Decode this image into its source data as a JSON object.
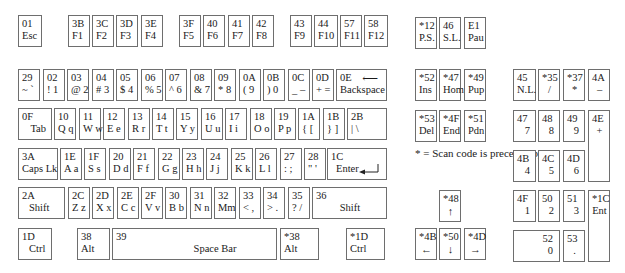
{
  "note": "* = Scan code is preceded by E0",
  "keys": {
    "esc": {
      "code": "01",
      "label": "Esc"
    },
    "f1": {
      "code": "3B",
      "label": "F1"
    },
    "f2": {
      "code": "3C",
      "label": "F2"
    },
    "f3": {
      "code": "3D",
      "label": "F3"
    },
    "f4": {
      "code": "3E",
      "label": "F4"
    },
    "f5": {
      "code": "3F",
      "label": "F5"
    },
    "f6": {
      "code": "40",
      "label": "F6"
    },
    "f7": {
      "code": "41",
      "label": "F7"
    },
    "f8": {
      "code": "42",
      "label": "F8"
    },
    "f9": {
      "code": "43",
      "label": "F9"
    },
    "f10": {
      "code": "44",
      "label": "F10"
    },
    "f11": {
      "code": "57",
      "label": "F11"
    },
    "f12": {
      "code": "58",
      "label": "F12"
    },
    "ps": {
      "code": "*12",
      "label": "P.S."
    },
    "sl": {
      "code": "46",
      "label": "S.L."
    },
    "pau": {
      "code": "E1",
      "label": "Pau"
    },
    "grave": {
      "code": "29",
      "label": "~ `"
    },
    "k1": {
      "code": "02",
      "label": "! 1"
    },
    "k2": {
      "code": "03",
      "label": "@ 2"
    },
    "k3": {
      "code": "04",
      "label": "# 3"
    },
    "k4": {
      "code": "05",
      "label": "$ 4"
    },
    "k5": {
      "code": "06",
      "label": "% 5"
    },
    "k6": {
      "code": "07",
      "label": "^ 6"
    },
    "k7": {
      "code": "08",
      "label": "& 7"
    },
    "k8": {
      "code": "09",
      "label": "* 8"
    },
    "k9": {
      "code": "0A",
      "label": "( 9"
    },
    "k0": {
      "code": "0B",
      "label": ") 0"
    },
    "minus": {
      "code": "0C",
      "label": "_ –"
    },
    "equals": {
      "code": "0D",
      "label": "+ ="
    },
    "backspace": {
      "code": "0E",
      "label": "Backspace",
      "arrow": "⟵"
    },
    "tab": {
      "code": "0F",
      "label": "Tab"
    },
    "q": {
      "code": "10",
      "label": "Q q"
    },
    "w": {
      "code": "11",
      "label": "W w"
    },
    "e": {
      "code": "12",
      "label": "E e"
    },
    "r": {
      "code": "13",
      "label": "R r"
    },
    "t": {
      "code": "14",
      "label": "T t"
    },
    "y": {
      "code": "15",
      "label": "Y y"
    },
    "u": {
      "code": "16",
      "label": "U u"
    },
    "i": {
      "code": "17",
      "label": "I i"
    },
    "o": {
      "code": "18",
      "label": "O o"
    },
    "p": {
      "code": "19",
      "label": "P p"
    },
    "lbracket": {
      "code": "1A",
      "label": "{ ["
    },
    "rbracket": {
      "code": "1B",
      "label": "} ]"
    },
    "backslash": {
      "code": "2B",
      "label": "| \\"
    },
    "caps": {
      "code": "3A",
      "label": "Caps Lk"
    },
    "a": {
      "code": "1E",
      "label": "A a"
    },
    "s": {
      "code": "1F",
      "label": "S s"
    },
    "d": {
      "code": "20",
      "label": "D d"
    },
    "f": {
      "code": "21",
      "label": "F f"
    },
    "g": {
      "code": "22",
      "label": "G g"
    },
    "h": {
      "code": "23",
      "label": "H h"
    },
    "j": {
      "code": "24",
      "label": "J j"
    },
    "k": {
      "code": "25",
      "label": "K k"
    },
    "l": {
      "code": "26",
      "label": "L l"
    },
    "semicolon": {
      "code": "27",
      "label": ": ;"
    },
    "quote": {
      "code": "28",
      "label": "\" '"
    },
    "enter": {
      "code": "1C",
      "label": "Enter"
    },
    "lshift": {
      "code": "2A",
      "label": "Shift"
    },
    "z": {
      "code": "2C",
      "label": "Z z"
    },
    "x": {
      "code": "2D",
      "label": "X x"
    },
    "c": {
      "code": "2E",
      "label": "C c"
    },
    "v": {
      "code": "2F",
      "label": "V v"
    },
    "b": {
      "code": "30",
      "label": "B b"
    },
    "n": {
      "code": "31",
      "label": "N n"
    },
    "m": {
      "code": "32",
      "label": "Mm"
    },
    "comma": {
      "code": "33",
      "label": "< ,"
    },
    "period": {
      "code": "34",
      "label": "> ."
    },
    "slash": {
      "code": "35",
      "label": "? /"
    },
    "rshift": {
      "code": "36",
      "label": "Shift"
    },
    "lctrl": {
      "code": "1D",
      "label": "Ctrl"
    },
    "lalt": {
      "code": "38",
      "label": "Alt"
    },
    "space": {
      "code": "39",
      "label": "Space Bar"
    },
    "ralt": {
      "code": "*38",
      "label": "Alt"
    },
    "rctrl": {
      "code": "*1D",
      "label": "Ctrl"
    },
    "ins": {
      "code": "*52",
      "label": "Ins"
    },
    "hom": {
      "code": "*47",
      "label": "Hom"
    },
    "pup": {
      "code": "*49",
      "label": "Pup"
    },
    "del": {
      "code": "*53",
      "label": "Del"
    },
    "end": {
      "code": "*4F",
      "label": "End"
    },
    "pdn": {
      "code": "*51",
      "label": "Pdn"
    },
    "up": {
      "code": "*48",
      "label": "↑"
    },
    "left": {
      "code": "*4B",
      "label": "←"
    },
    "down": {
      "code": "*50",
      "label": "↓"
    },
    "right": {
      "code": "*4D",
      "label": "→"
    },
    "numlock": {
      "code": "45",
      "label": "N.L."
    },
    "kpdiv": {
      "code": "*35",
      "label": "/"
    },
    "kpmul": {
      "code": "*37",
      "label": "*"
    },
    "kpminus": {
      "code": "4A",
      "label": "–"
    },
    "kp7": {
      "code": "47",
      "label": "7"
    },
    "kp8": {
      "code": "48",
      "label": "8"
    },
    "kp9": {
      "code": "49",
      "label": "9"
    },
    "kpplus": {
      "code": "4E",
      "label": "+"
    },
    "kp4": {
      "code": "4B",
      "label": "4"
    },
    "kp5": {
      "code": "4C",
      "label": "5"
    },
    "kp6": {
      "code": "4D",
      "label": "6"
    },
    "kp1": {
      "code": "4F",
      "label": "1"
    },
    "kp2": {
      "code": "50",
      "label": "2"
    },
    "kp3": {
      "code": "51",
      "label": "3"
    },
    "kpenter": {
      "code": "*1C",
      "label": "Ent"
    },
    "kp0": {
      "code": "52",
      "label": "0"
    },
    "kpdot": {
      "code": "53",
      "label": "."
    }
  }
}
